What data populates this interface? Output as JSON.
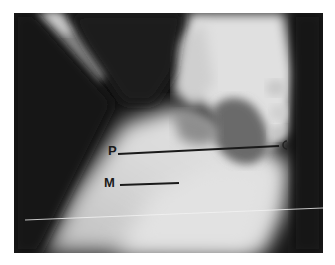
{
  "image": {
    "type": "radiograph",
    "description": "Grayscale lateral X-ray (contrast study) with annotation lines",
    "labels": [
      {
        "id": "P",
        "text": "P"
      },
      {
        "id": "M",
        "text": "M"
      }
    ],
    "colors": {
      "background": "#ffffff",
      "film_dark": "#141414",
      "soft_tissue_light": "#d8d8d8",
      "annotation": "#1a1a1a"
    }
  }
}
